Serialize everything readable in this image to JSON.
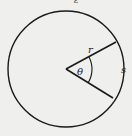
{
  "diagram": {
    "type": "circle-sector",
    "background": "#efefed",
    "stroke": "#1a1a1a",
    "labels": {
      "radius": "r",
      "angle": "θ",
      "arc": "s",
      "top_fragment": "ε"
    }
  }
}
